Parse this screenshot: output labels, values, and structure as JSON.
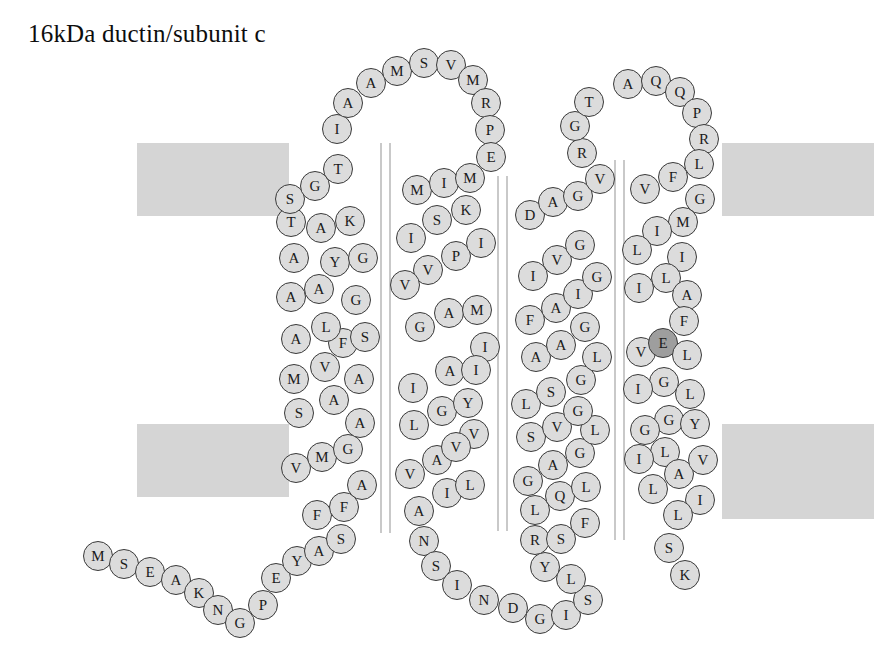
{
  "title": "16kDa ductin/subunit c",
  "colors": {
    "membrane": "#d5d5d5",
    "residue_fill": "#dcdcdc",
    "residue_stroke": "#3a3a3a",
    "residue_highlight_fill": "#9e9e9e",
    "helix_rule": "#c9c9c9",
    "background": "#ffffff",
    "text": "#1a1a1a"
  },
  "membrane_bands": [
    {
      "name": "membrane-band-top-left",
      "x": 137,
      "y": 143,
      "w": 152,
      "h": 73
    },
    {
      "name": "membrane-band-top-right",
      "x": 722,
      "y": 143,
      "w": 152,
      "h": 73
    },
    {
      "name": "membrane-band-bottom-left",
      "x": 137,
      "y": 424,
      "w": 152,
      "h": 73
    },
    {
      "name": "membrane-band-bottom-right",
      "x": 722,
      "y": 424,
      "w": 152,
      "h": 95
    }
  ],
  "helix_rules": [
    {
      "name": "helix-rule-1a",
      "x": 380,
      "y": 143,
      "h": 390
    },
    {
      "name": "helix-rule-1b",
      "x": 389,
      "y": 143,
      "h": 390
    },
    {
      "name": "helix-rule-2a",
      "x": 497,
      "y": 176,
      "h": 355
    },
    {
      "name": "helix-rule-2b",
      "x": 506,
      "y": 176,
      "h": 355
    },
    {
      "name": "helix-rule-3a",
      "x": 614,
      "y": 160,
      "h": 380
    },
    {
      "name": "helix-rule-3b",
      "x": 623,
      "y": 160,
      "h": 380
    }
  ],
  "sequence_label": "MSEAKNGPEYASFFAVMGSAMVFALAAYGAKTSGTIAAMSVMRPEMIMSKIPIVVAMGIAIIGYLVAVVILANSINDGISLYRSFQLLGAGLSVGLSGLAAGFAIGIVGDAGVRGTAQQPRLFVGMILILIAFVELGLIGLIGYGLILAVLILSK",
  "residues": [
    {
      "i": 1,
      "aa": "M",
      "x": 98,
      "y": 556,
      "region": "n-terminus"
    },
    {
      "i": 2,
      "aa": "S",
      "x": 124,
      "y": 564,
      "region": "n-terminus"
    },
    {
      "i": 3,
      "aa": "E",
      "x": 150,
      "y": 572,
      "region": "n-terminus"
    },
    {
      "i": 4,
      "aa": "A",
      "x": 176,
      "y": 580,
      "region": "n-terminus"
    },
    {
      "i": 5,
      "aa": "K",
      "x": 199,
      "y": 593,
      "region": "n-terminus"
    },
    {
      "i": 6,
      "aa": "N",
      "x": 218,
      "y": 610,
      "region": "n-terminus"
    },
    {
      "i": 7,
      "aa": "G",
      "x": 240,
      "y": 623,
      "region": "n-terminus"
    },
    {
      "i": 8,
      "aa": "P",
      "x": 263,
      "y": 605,
      "region": "n-terminus"
    },
    {
      "i": 9,
      "aa": "E",
      "x": 276,
      "y": 578,
      "region": "n-terminus"
    },
    {
      "i": 10,
      "aa": "Y",
      "x": 297,
      "y": 561,
      "region": "n-terminus"
    },
    {
      "i": 11,
      "aa": "A",
      "x": 319,
      "y": 551,
      "region": "n-terminus"
    },
    {
      "i": 12,
      "aa": "S",
      "x": 341,
      "y": 539,
      "region": "n-terminus"
    },
    {
      "i": 13,
      "aa": "F",
      "x": 317,
      "y": 515,
      "region": "tm1"
    },
    {
      "i": 14,
      "aa": "F",
      "x": 344,
      "y": 507,
      "region": "tm1"
    },
    {
      "i": 15,
      "aa": "A",
      "x": 362,
      "y": 485,
      "region": "tm1"
    },
    {
      "i": 16,
      "aa": "V",
      "x": 296,
      "y": 468,
      "region": "tm1"
    },
    {
      "i": 17,
      "aa": "M",
      "x": 322,
      "y": 457,
      "region": "tm1"
    },
    {
      "i": 18,
      "aa": "G",
      "x": 348,
      "y": 449,
      "region": "tm1"
    },
    {
      "i": 19,
      "aa": "S",
      "x": 299,
      "y": 413,
      "region": "tm1"
    },
    {
      "i": 20,
      "aa": "A",
      "x": 334,
      "y": 400,
      "region": "tm1"
    },
    {
      "i": 21,
      "aa": "A",
      "x": 360,
      "y": 423,
      "region": "tm1"
    },
    {
      "i": 22,
      "aa": "M",
      "x": 294,
      "y": 379,
      "region": "tm1"
    },
    {
      "i": 23,
      "aa": "V",
      "x": 325,
      "y": 367,
      "region": "tm1"
    },
    {
      "i": 24,
      "aa": "A",
      "x": 359,
      "y": 379,
      "region": "tm1"
    },
    {
      "i": 25,
      "aa": "F",
      "x": 343,
      "y": 343,
      "region": "tm1"
    },
    {
      "i": 26,
      "aa": "A",
      "x": 296,
      "y": 339,
      "region": "tm1"
    },
    {
      "i": 27,
      "aa": "L",
      "x": 326,
      "y": 327,
      "region": "tm1"
    },
    {
      "i": 28,
      "aa": "S",
      "x": 365,
      "y": 337,
      "region": "tm1"
    },
    {
      "i": 29,
      "aa": "A",
      "x": 291,
      "y": 297,
      "region": "tm1"
    },
    {
      "i": 30,
      "aa": "A",
      "x": 319,
      "y": 289,
      "region": "tm1"
    },
    {
      "i": 31,
      "aa": "G",
      "x": 356,
      "y": 300,
      "region": "tm1"
    },
    {
      "i": 32,
      "aa": "Y",
      "x": 335,
      "y": 262,
      "region": "tm1"
    },
    {
      "i": 33,
      "aa": "G",
      "x": 363,
      "y": 258,
      "region": "tm1"
    },
    {
      "i": 34,
      "aa": "A",
      "x": 294,
      "y": 258,
      "region": "tm1"
    },
    {
      "i": 35,
      "aa": "K",
      "x": 350,
      "y": 221,
      "region": "tm1"
    },
    {
      "i": 36,
      "aa": "T",
      "x": 291,
      "y": 222,
      "region": "tm1"
    },
    {
      "i": 37,
      "aa": "A",
      "x": 321,
      "y": 228,
      "region": "tm1"
    },
    {
      "i": 38,
      "aa": "S",
      "x": 290,
      "y": 199,
      "region": "loop1"
    },
    {
      "i": 39,
      "aa": "G",
      "x": 315,
      "y": 186,
      "region": "loop1"
    },
    {
      "i": 40,
      "aa": "T",
      "x": 338,
      "y": 169,
      "region": "loop1"
    },
    {
      "i": 41,
      "aa": "I",
      "x": 337,
      "y": 129,
      "region": "loop1"
    },
    {
      "i": 42,
      "aa": "A",
      "x": 348,
      "y": 103,
      "region": "loop1"
    },
    {
      "i": 43,
      "aa": "A",
      "x": 371,
      "y": 83,
      "region": "loop1"
    },
    {
      "i": 44,
      "aa": "M",
      "x": 397,
      "y": 71,
      "region": "loop1"
    },
    {
      "i": 45,
      "aa": "S",
      "x": 424,
      "y": 63,
      "region": "loop1"
    },
    {
      "i": 46,
      "aa": "V",
      "x": 451,
      "y": 65,
      "region": "loop1"
    },
    {
      "i": 47,
      "aa": "M",
      "x": 473,
      "y": 80,
      "region": "loop1"
    },
    {
      "i": 48,
      "aa": "R",
      "x": 486,
      "y": 103,
      "region": "loop1"
    },
    {
      "i": 49,
      "aa": "P",
      "x": 490,
      "y": 130,
      "region": "loop1"
    },
    {
      "i": 50,
      "aa": "E",
      "x": 491,
      "y": 157,
      "region": "loop1"
    },
    {
      "i": 51,
      "aa": "M",
      "x": 417,
      "y": 190,
      "region": "tm2"
    },
    {
      "i": 52,
      "aa": "I",
      "x": 444,
      "y": 183,
      "region": "tm2"
    },
    {
      "i": 53,
      "aa": "M",
      "x": 470,
      "y": 178,
      "region": "tm2"
    },
    {
      "i": 54,
      "aa": "S",
      "x": 437,
      "y": 220,
      "region": "tm2"
    },
    {
      "i": 55,
      "aa": "K",
      "x": 466,
      "y": 210,
      "region": "tm2"
    },
    {
      "i": 56,
      "aa": "I",
      "x": 411,
      "y": 238,
      "region": "tm2"
    },
    {
      "i": 57,
      "aa": "P",
      "x": 456,
      "y": 256,
      "region": "tm2"
    },
    {
      "i": 58,
      "aa": "I",
      "x": 481,
      "y": 243,
      "region": "tm2"
    },
    {
      "i": 59,
      "aa": "V",
      "x": 428,
      "y": 270,
      "region": "tm2"
    },
    {
      "i": 60,
      "aa": "V",
      "x": 405,
      "y": 285,
      "region": "tm2"
    },
    {
      "i": 61,
      "aa": "A",
      "x": 449,
      "y": 313,
      "region": "tm2"
    },
    {
      "i": 62,
      "aa": "M",
      "x": 477,
      "y": 310,
      "region": "tm2"
    },
    {
      "i": 63,
      "aa": "G",
      "x": 420,
      "y": 327,
      "region": "tm2"
    },
    {
      "i": 64,
      "aa": "I",
      "x": 485,
      "y": 347,
      "region": "tm2"
    },
    {
      "i": 65,
      "aa": "A",
      "x": 450,
      "y": 371,
      "region": "tm2"
    },
    {
      "i": 66,
      "aa": "I",
      "x": 476,
      "y": 370,
      "region": "tm2"
    },
    {
      "i": 67,
      "aa": "I",
      "x": 413,
      "y": 388,
      "region": "tm2"
    },
    {
      "i": 68,
      "aa": "G",
      "x": 442,
      "y": 411,
      "region": "tm2"
    },
    {
      "i": 69,
      "aa": "Y",
      "x": 468,
      "y": 403,
      "region": "tm2"
    },
    {
      "i": 70,
      "aa": "L",
      "x": 414,
      "y": 425,
      "region": "tm2"
    },
    {
      "i": 71,
      "aa": "V",
      "x": 474,
      "y": 434,
      "region": "tm2"
    },
    {
      "i": 72,
      "aa": "A",
      "x": 437,
      "y": 460,
      "region": "tm2"
    },
    {
      "i": 73,
      "aa": "V",
      "x": 456,
      "y": 447,
      "region": "tm2"
    },
    {
      "i": 74,
      "aa": "V",
      "x": 410,
      "y": 474,
      "region": "tm2"
    },
    {
      "i": 75,
      "aa": "I",
      "x": 447,
      "y": 493,
      "region": "tm2"
    },
    {
      "i": 76,
      "aa": "L",
      "x": 470,
      "y": 485,
      "region": "tm2"
    },
    {
      "i": 77,
      "aa": "A",
      "x": 419,
      "y": 511,
      "region": "tm2"
    },
    {
      "i": 78,
      "aa": "N",
      "x": 424,
      "y": 541,
      "region": "tm2"
    },
    {
      "i": 79,
      "aa": "S",
      "x": 436,
      "y": 566,
      "region": "tm2"
    },
    {
      "i": 80,
      "aa": "I",
      "x": 457,
      "y": 585,
      "region": "tm2"
    },
    {
      "i": 81,
      "aa": "N",
      "x": 484,
      "y": 600,
      "region": "loop2"
    },
    {
      "i": 82,
      "aa": "D",
      "x": 513,
      "y": 608,
      "region": "loop2"
    },
    {
      "i": 83,
      "aa": "G",
      "x": 540,
      "y": 619,
      "region": "loop2"
    },
    {
      "i": 84,
      "aa": "I",
      "x": 566,
      "y": 615,
      "region": "loop2"
    },
    {
      "i": 85,
      "aa": "S",
      "x": 588,
      "y": 600,
      "region": "loop2"
    },
    {
      "i": 86,
      "aa": "L",
      "x": 571,
      "y": 579,
      "region": "loop2"
    },
    {
      "i": 87,
      "aa": "Y",
      "x": 545,
      "y": 567,
      "region": "loop2"
    },
    {
      "i": 88,
      "aa": "R",
      "x": 535,
      "y": 540,
      "region": "loop2"
    },
    {
      "i": 89,
      "aa": "S",
      "x": 561,
      "y": 539,
      "region": "loop2"
    },
    {
      "i": 90,
      "aa": "F",
      "x": 585,
      "y": 523,
      "region": "loop2"
    },
    {
      "i": 91,
      "aa": "L",
      "x": 535,
      "y": 510,
      "region": "tm3"
    },
    {
      "i": 92,
      "aa": "Q",
      "x": 560,
      "y": 496,
      "region": "tm3"
    },
    {
      "i": 93,
      "aa": "L",
      "x": 586,
      "y": 487,
      "region": "tm3"
    },
    {
      "i": 94,
      "aa": "G",
      "x": 528,
      "y": 481,
      "region": "tm3"
    },
    {
      "i": 95,
      "aa": "A",
      "x": 553,
      "y": 465,
      "region": "tm3"
    },
    {
      "i": 96,
      "aa": "G",
      "x": 580,
      "y": 453,
      "region": "tm3"
    },
    {
      "i": 97,
      "aa": "L",
      "x": 595,
      "y": 430,
      "region": "tm3"
    },
    {
      "i": 98,
      "aa": "S",
      "x": 531,
      "y": 437,
      "region": "tm3"
    },
    {
      "i": 99,
      "aa": "V",
      "x": 557,
      "y": 427,
      "region": "tm3"
    },
    {
      "i": 100,
      "aa": "G",
      "x": 578,
      "y": 411,
      "region": "tm3"
    },
    {
      "i": 101,
      "aa": "L",
      "x": 526,
      "y": 404,
      "region": "tm3"
    },
    {
      "i": 102,
      "aa": "S",
      "x": 551,
      "y": 392,
      "region": "tm3"
    },
    {
      "i": 103,
      "aa": "G",
      "x": 581,
      "y": 380,
      "region": "tm3"
    },
    {
      "i": 104,
      "aa": "L",
      "x": 597,
      "y": 357,
      "region": "tm3"
    },
    {
      "i": 105,
      "aa": "A",
      "x": 536,
      "y": 357,
      "region": "tm3"
    },
    {
      "i": 106,
      "aa": "A",
      "x": 561,
      "y": 345,
      "region": "tm3"
    },
    {
      "i": 107,
      "aa": "G",
      "x": 585,
      "y": 327,
      "region": "tm3"
    },
    {
      "i": 108,
      "aa": "F",
      "x": 530,
      "y": 320,
      "region": "tm3"
    },
    {
      "i": 109,
      "aa": "A",
      "x": 556,
      "y": 308,
      "region": "tm3"
    },
    {
      "i": 110,
      "aa": "I",
      "x": 578,
      "y": 294,
      "region": "tm3"
    },
    {
      "i": 111,
      "aa": "G",
      "x": 597,
      "y": 277,
      "region": "tm3"
    },
    {
      "i": 112,
      "aa": "I",
      "x": 533,
      "y": 276,
      "region": "tm3"
    },
    {
      "i": 113,
      "aa": "V",
      "x": 557,
      "y": 260,
      "region": "tm3"
    },
    {
      "i": 114,
      "aa": "G",
      "x": 580,
      "y": 245,
      "region": "tm3"
    },
    {
      "i": 115,
      "aa": "D",
      "x": 530,
      "y": 215,
      "region": "tm3"
    },
    {
      "i": 116,
      "aa": "A",
      "x": 553,
      "y": 202,
      "region": "tm3"
    },
    {
      "i": 117,
      "aa": "G",
      "x": 578,
      "y": 196,
      "region": "tm3"
    },
    {
      "i": 118,
      "aa": "V",
      "x": 600,
      "y": 179,
      "region": "tm3"
    },
    {
      "i": 119,
      "aa": "R",
      "x": 582,
      "y": 153,
      "region": "tm3"
    },
    {
      "i": 120,
      "aa": "G",
      "x": 575,
      "y": 126,
      "region": "tm3"
    },
    {
      "i": 121,
      "aa": "T",
      "x": 589,
      "y": 102,
      "region": "tm3"
    },
    {
      "i": 122,
      "aa": "A",
      "x": 628,
      "y": 84,
      "region": "loop3"
    },
    {
      "i": 123,
      "aa": "Q",
      "x": 656,
      "y": 81,
      "region": "loop3"
    },
    {
      "i": 124,
      "aa": "Q",
      "x": 680,
      "y": 92,
      "region": "loop3"
    },
    {
      "i": 125,
      "aa": "P",
      "x": 697,
      "y": 113,
      "region": "loop3"
    },
    {
      "i": 126,
      "aa": "R",
      "x": 704,
      "y": 139,
      "region": "loop3"
    },
    {
      "i": 127,
      "aa": "L",
      "x": 699,
      "y": 164,
      "region": "loop3"
    },
    {
      "i": 128,
      "aa": "F",
      "x": 673,
      "y": 177,
      "region": "loop3"
    },
    {
      "i": 129,
      "aa": "V",
      "x": 645,
      "y": 189,
      "region": "loop3"
    },
    {
      "i": 130,
      "aa": "G",
      "x": 700,
      "y": 199,
      "region": "loop3"
    },
    {
      "i": 131,
      "aa": "M",
      "x": 683,
      "y": 222,
      "region": "loop3"
    },
    {
      "i": 132,
      "aa": "I",
      "x": 657,
      "y": 231,
      "region": "tm4"
    },
    {
      "i": 133,
      "aa": "L",
      "x": 637,
      "y": 250,
      "region": "tm4"
    },
    {
      "i": 134,
      "aa": "I",
      "x": 682,
      "y": 257,
      "region": "tm4"
    },
    {
      "i": 135,
      "aa": "L",
      "x": 666,
      "y": 278,
      "region": "tm4"
    },
    {
      "i": 136,
      "aa": "I",
      "x": 639,
      "y": 288,
      "region": "tm4"
    },
    {
      "i": 137,
      "aa": "A",
      "x": 687,
      "y": 295,
      "region": "tm4"
    },
    {
      "i": 138,
      "aa": "F",
      "x": 684,
      "y": 321,
      "region": "tm4"
    },
    {
      "i": 139,
      "aa": "V",
      "x": 641,
      "y": 352,
      "region": "tm4"
    },
    {
      "i": 140,
      "aa": "E",
      "x": 663,
      "y": 343,
      "region": "tm4",
      "highlight": true
    },
    {
      "i": 141,
      "aa": "L",
      "x": 687,
      "y": 355,
      "region": "tm4"
    },
    {
      "i": 142,
      "aa": "G",
      "x": 664,
      "y": 382,
      "region": "tm4"
    },
    {
      "i": 143,
      "aa": "L",
      "x": 690,
      "y": 394,
      "region": "tm4"
    },
    {
      "i": 144,
      "aa": "I",
      "x": 638,
      "y": 389,
      "region": "tm4"
    },
    {
      "i": 145,
      "aa": "G",
      "x": 669,
      "y": 420,
      "region": "tm4"
    },
    {
      "i": 146,
      "aa": "Y",
      "x": 695,
      "y": 424,
      "region": "tm4"
    },
    {
      "i": 147,
      "aa": "G",
      "x": 645,
      "y": 430,
      "region": "tm4"
    },
    {
      "i": 148,
      "aa": "L",
      "x": 665,
      "y": 452,
      "region": "c-terminus"
    },
    {
      "i": 149,
      "aa": "I",
      "x": 639,
      "y": 459,
      "region": "c-terminus"
    },
    {
      "i": 150,
      "aa": "A",
      "x": 679,
      "y": 474,
      "region": "c-terminus"
    },
    {
      "i": 151,
      "aa": "V",
      "x": 703,
      "y": 460,
      "region": "c-terminus"
    },
    {
      "i": 152,
      "aa": "L",
      "x": 653,
      "y": 489,
      "region": "c-terminus"
    },
    {
      "i": 153,
      "aa": "I",
      "x": 700,
      "y": 500,
      "region": "c-terminus"
    },
    {
      "i": 154,
      "aa": "L",
      "x": 678,
      "y": 515,
      "region": "c-terminus"
    },
    {
      "i": 155,
      "aa": "S",
      "x": 669,
      "y": 548,
      "region": "c-terminus"
    },
    {
      "i": 156,
      "aa": "K",
      "x": 685,
      "y": 575,
      "region": "c-terminus"
    }
  ]
}
